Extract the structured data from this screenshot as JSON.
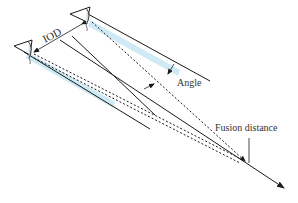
{
  "diagram": {
    "labels": {
      "iod": "IOD",
      "angle": "Angle",
      "fusion_distance": "Fusion distance"
    },
    "elements": {
      "left_eye": "eye-icon",
      "right_eye": "eye-icon",
      "view_axis": "arrow",
      "left_frustum": "viewing-frustum",
      "right_frustum": "viewing-frustum"
    },
    "colors": {
      "line": "#1a1a1a",
      "frustum_fill": "#cfeaf5",
      "text": "#333333",
      "background": "#ffffff"
    }
  }
}
